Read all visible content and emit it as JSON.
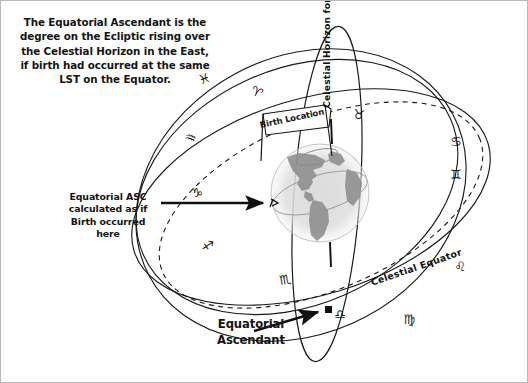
{
  "figure": {
    "domain_kind": "diagram",
    "background_color": "#ffffff",
    "ink_color": "#141414",
    "border_color": "#b9b9b9"
  },
  "intro": {
    "text": "The Equatorial Ascendant is the\ndegree on the Ecliptic rising over\nthe Celestial Horizon in the East,\nif birth had occurred at the same\nLST on the Equator."
  },
  "annotations": {
    "equatorial_asc_note": "Equatorial ASC\ncalculated as if\nBirth occurred\nhere",
    "equatorial_ascendant": "Equatorial\nAscendant",
    "birth_location": "Birth Location",
    "celestial_horizon": "Celestial Horizon  for  Equatorial position",
    "celestial_equator": "Celestial Equator"
  },
  "elements": {
    "globe_name": "earth-globe",
    "globe_description": "grayscale Earth showing the Americas",
    "horizon_circle_name": "celestial-horizon-circle",
    "equator_circle_name": "celestial-equator-circle",
    "ecliptic_circle_name": "ecliptic-dashed-circle",
    "ascendant_marker_name": "equatorial-ascendant-marker",
    "birth_marker_name": "birth-location-flag",
    "axis_tick_name": "polar-axis-tick"
  },
  "zodiac_glyphs": [
    {
      "name": "aries",
      "symbol": "♈"
    },
    {
      "name": "taurus",
      "symbol": "♉"
    },
    {
      "name": "gemini",
      "symbol": "♊"
    },
    {
      "name": "cancer",
      "symbol": "♋"
    },
    {
      "name": "leo",
      "symbol": "♌"
    },
    {
      "name": "virgo",
      "symbol": "♍"
    },
    {
      "name": "libra",
      "symbol": "♎"
    },
    {
      "name": "scorpio",
      "symbol": "♏"
    },
    {
      "name": "sagittarius",
      "symbol": "♐"
    },
    {
      "name": "capricorn",
      "symbol": "♑"
    },
    {
      "name": "aquarius",
      "symbol": "♒"
    },
    {
      "name": "pisces",
      "symbol": "♓"
    }
  ],
  "glyph_placements": [
    {
      "name": "glyph-pisces",
      "symbol": "♓",
      "x": 205,
      "y": 82,
      "rot": -20
    },
    {
      "name": "glyph-aries",
      "symbol": "♈",
      "x": 254,
      "y": 95,
      "rot": 25
    },
    {
      "name": "glyph-taurus",
      "symbol": "♉",
      "x": 357,
      "y": 118,
      "rot": 10
    },
    {
      "name": "glyph-gemini",
      "symbol": "♊",
      "x": 455,
      "y": 178,
      "rot": 0
    },
    {
      "name": "glyph-cancer",
      "symbol": "♋",
      "x": 455,
      "y": 145,
      "rot": 0
    },
    {
      "name": "glyph-leo",
      "symbol": "♌",
      "x": 459,
      "y": 270,
      "rot": 0
    },
    {
      "name": "glyph-virgo",
      "symbol": "♍",
      "x": 408,
      "y": 323,
      "rot": 0
    },
    {
      "name": "glyph-libra",
      "symbol": "♎",
      "x": 339,
      "y": 318,
      "rot": 0
    },
    {
      "name": "glyph-scorpio",
      "symbol": "♏",
      "x": 285,
      "y": 283,
      "rot": -10
    },
    {
      "name": "glyph-sagittarius",
      "symbol": "♐",
      "x": 206,
      "y": 249,
      "rot": 10
    },
    {
      "name": "glyph-capricorn",
      "symbol": "♑",
      "x": 196,
      "y": 196,
      "rot": 0
    },
    {
      "name": "glyph-aquarius",
      "symbol": "♒",
      "x": 188,
      "y": 141,
      "rot": 20
    }
  ]
}
